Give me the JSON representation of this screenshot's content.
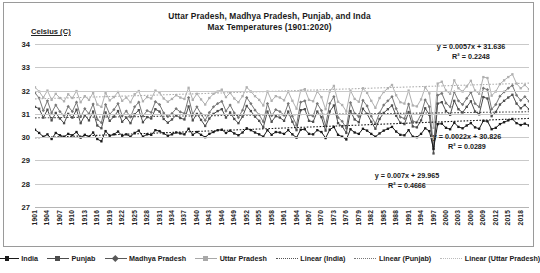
{
  "chart_data": {
    "type": "line",
    "title": "Uttar Pradesh, Madhya Pradesh, Punjab, and Inda\nMax Temperatures (1901:2020)",
    "title_line1": "Uttar Pradesh, Madhya Pradesh, Punjab, and Inda",
    "title_line2": "Max Temperatures (1901:2020)",
    "ylabel": "Celsius (C)",
    "xlabel": "",
    "ylim": [
      27,
      34
    ],
    "yticks": [
      34,
      33,
      32,
      31,
      30,
      29,
      28,
      27
    ],
    "xlim": [
      1901,
      2020
    ],
    "xticks": [
      1901,
      1904,
      1907,
      1910,
      1913,
      1916,
      1919,
      1922,
      1925,
      1928,
      1931,
      1934,
      1937,
      1940,
      1943,
      1946,
      1949,
      1952,
      1955,
      1958,
      1961,
      1964,
      1967,
      1970,
      1973,
      1976,
      1979,
      1982,
      1985,
      1988,
      1991,
      1994,
      1997,
      2000,
      2003,
      2006,
      2009,
      2012,
      2015,
      2018
    ],
    "grid": true,
    "legend_position": "bottom",
    "x": [
      1901,
      1902,
      1903,
      1904,
      1905,
      1906,
      1907,
      1908,
      1909,
      1910,
      1911,
      1912,
      1913,
      1914,
      1915,
      1916,
      1917,
      1918,
      1919,
      1920,
      1921,
      1922,
      1923,
      1924,
      1925,
      1926,
      1927,
      1928,
      1929,
      1930,
      1931,
      1932,
      1933,
      1934,
      1935,
      1936,
      1937,
      1938,
      1939,
      1940,
      1941,
      1942,
      1943,
      1944,
      1945,
      1946,
      1947,
      1948,
      1949,
      1950,
      1951,
      1952,
      1953,
      1954,
      1955,
      1956,
      1957,
      1958,
      1959,
      1960,
      1961,
      1962,
      1963,
      1964,
      1965,
      1966,
      1967,
      1968,
      1969,
      1970,
      1971,
      1972,
      1973,
      1974,
      1975,
      1976,
      1977,
      1978,
      1979,
      1980,
      1981,
      1982,
      1983,
      1984,
      1985,
      1986,
      1987,
      1988,
      1989,
      1990,
      1991,
      1992,
      1993,
      1994,
      1995,
      1996,
      1997,
      1998,
      1999,
      2000,
      2001,
      2002,
      2003,
      2004,
      2005,
      2006,
      2007,
      2008,
      2009,
      2010,
      2011,
      2012,
      2013,
      2014,
      2015,
      2016,
      2017,
      2018,
      2019,
      2020
    ],
    "series": [
      {
        "name": "India",
        "color": "#1a1a1a",
        "marker": "square",
        "values": [
          30.32,
          30.18,
          30.02,
          30.12,
          29.92,
          30.18,
          30.08,
          30.02,
          30.14,
          30.08,
          30.22,
          29.98,
          30.1,
          30.02,
          30.2,
          29.92,
          29.82,
          30.26,
          30.06,
          30.12,
          30.24,
          30.06,
          30.12,
          30.02,
          30.18,
          30.28,
          30.02,
          30.12,
          30.1,
          30.3,
          30.26,
          30.16,
          30.06,
          30.12,
          30.2,
          30.16,
          30.12,
          30.36,
          30.1,
          30.22,
          30.1,
          30.0,
          30.14,
          30.22,
          30.3,
          30.32,
          30.18,
          30.28,
          30.16,
          30.08,
          30.2,
          30.38,
          30.3,
          30.2,
          30.12,
          30.02,
          30.3,
          30.1,
          30.22,
          30.2,
          30.14,
          30.3,
          30.12,
          29.98,
          30.32,
          30.34,
          30.14,
          30.12,
          30.3,
          30.22,
          29.96,
          30.32,
          30.44,
          30.1,
          30.02,
          29.9,
          30.34,
          30.2,
          30.14,
          30.36,
          30.28,
          30.14,
          30.02,
          30.16,
          30.28,
          30.36,
          30.44,
          30.24,
          30.1,
          30.08,
          30.3,
          30.02,
          30.0,
          30.14,
          30.38,
          30.26,
          29.5,
          30.56,
          30.58,
          30.4,
          30.34,
          30.62,
          30.44,
          30.38,
          30.5,
          30.6,
          30.42,
          30.36,
          30.7,
          30.68,
          30.34,
          30.4,
          30.56,
          30.64,
          30.72,
          30.78,
          30.6,
          30.52,
          30.58,
          30.5
        ]
      },
      {
        "name": "Punjab",
        "color": "#4d4d4d",
        "marker": "square",
        "values": [
          31.3,
          31.22,
          30.84,
          31.18,
          30.72,
          31.04,
          30.8,
          30.6,
          31.0,
          30.84,
          31.18,
          30.6,
          30.94,
          30.72,
          31.1,
          30.5,
          30.38,
          31.06,
          30.7,
          30.88,
          31.12,
          30.66,
          30.84,
          30.6,
          30.98,
          31.16,
          30.64,
          30.86,
          30.8,
          31.2,
          31.1,
          30.78,
          30.62,
          30.76,
          30.94,
          30.82,
          30.76,
          31.32,
          30.72,
          31.0,
          30.74,
          30.48,
          30.8,
          31.0,
          31.12,
          31.2,
          30.84,
          31.06,
          30.78,
          30.6,
          30.88,
          31.34,
          31.12,
          30.88,
          30.7,
          30.42,
          31.1,
          30.66,
          30.9,
          30.84,
          30.7,
          31.1,
          30.66,
          30.3,
          31.16,
          31.2,
          30.7,
          30.66,
          31.1,
          30.86,
          30.28,
          31.1,
          31.36,
          30.6,
          30.46,
          30.18,
          31.12,
          30.76,
          30.64,
          31.22,
          31.0,
          30.66,
          30.36,
          30.78,
          31.04,
          31.2,
          31.36,
          30.92,
          30.62,
          30.56,
          31.08,
          30.46,
          30.42,
          30.72,
          31.24,
          30.96,
          29.3,
          31.44,
          31.5,
          31.12,
          30.96,
          31.56,
          31.2,
          31.06,
          31.3,
          31.54,
          31.1,
          30.98,
          31.72,
          31.66,
          30.9,
          31.08,
          31.4,
          31.56,
          31.7,
          31.82,
          31.44,
          31.24,
          31.38,
          31.2
        ]
      },
      {
        "name": "Madhya Pradesh",
        "color": "#777777",
        "marker": "diamond",
        "values": [
          31.9,
          31.68,
          31.14,
          31.56,
          31.04,
          31.38,
          31.1,
          30.92,
          31.32,
          31.1,
          31.5,
          30.88,
          31.22,
          31.0,
          31.42,
          30.76,
          30.62,
          31.4,
          30.98,
          31.18,
          31.44,
          30.92,
          31.12,
          30.86,
          31.3,
          31.5,
          30.9,
          31.14,
          31.06,
          31.52,
          31.4,
          31.04,
          30.88,
          31.02,
          31.22,
          31.08,
          31.02,
          31.7,
          30.98,
          31.3,
          31.0,
          30.72,
          31.06,
          31.3,
          31.44,
          31.54,
          31.12,
          31.38,
          31.04,
          30.84,
          31.16,
          31.7,
          31.44,
          31.16,
          30.96,
          30.66,
          31.44,
          30.92,
          31.18,
          31.1,
          30.94,
          31.44,
          30.9,
          30.52,
          31.5,
          31.56,
          30.96,
          30.9,
          31.44,
          31.14,
          30.5,
          31.44,
          31.74,
          30.84,
          30.68,
          30.38,
          31.48,
          31.02,
          30.88,
          31.58,
          31.34,
          30.9,
          30.58,
          31.04,
          31.38,
          31.56,
          31.74,
          31.22,
          30.86,
          30.8,
          31.42,
          30.68,
          30.64,
          30.98,
          31.6,
          31.3,
          29.6,
          31.8,
          31.88,
          31.46,
          31.3,
          31.94,
          31.56,
          31.4,
          31.66,
          31.92,
          31.44,
          31.3,
          32.1,
          32.04,
          31.2,
          31.4,
          31.76,
          31.94,
          32.1,
          32.22,
          31.8,
          31.58,
          31.74,
          31.54
        ]
      },
      {
        "name": "Uttar Pradesh",
        "color": "#b0b0b0",
        "marker": "square",
        "values": [
          32.14,
          31.96,
          31.7,
          32.0,
          31.6,
          31.86,
          31.68,
          31.54,
          31.84,
          31.68,
          31.98,
          31.5,
          31.76,
          31.6,
          31.9,
          31.4,
          31.3,
          31.9,
          31.58,
          31.72,
          31.94,
          31.56,
          31.7,
          31.5,
          31.84,
          31.98,
          31.54,
          31.72,
          31.66,
          32.0,
          31.92,
          31.66,
          31.52,
          31.64,
          31.8,
          31.7,
          31.64,
          32.12,
          31.6,
          31.86,
          31.62,
          31.4,
          31.68,
          31.86,
          31.96,
          32.04,
          31.72,
          31.9,
          31.66,
          31.5,
          31.76,
          32.14,
          31.96,
          31.76,
          31.6,
          31.36,
          31.96,
          31.56,
          31.76,
          31.7,
          31.58,
          31.96,
          31.56,
          31.22,
          32.0,
          32.06,
          31.6,
          31.54,
          31.96,
          31.72,
          31.2,
          31.96,
          32.2,
          31.52,
          31.38,
          31.1,
          32.0,
          31.64,
          31.52,
          32.1,
          31.9,
          31.56,
          31.26,
          31.68,
          31.94,
          32.1,
          32.24,
          31.8,
          31.5,
          31.44,
          32.0,
          31.36,
          31.32,
          31.62,
          32.14,
          31.88,
          30.4,
          32.3,
          32.38,
          32.0,
          31.86,
          32.44,
          32.1,
          31.96,
          32.18,
          32.42,
          32.0,
          31.86,
          32.58,
          32.54,
          31.78,
          31.96,
          32.28,
          32.44,
          32.58,
          32.7,
          32.3,
          32.1,
          32.24,
          32.06
        ]
      }
    ],
    "trendlines": [
      {
        "name": "Linear (Uttar Pradesh)",
        "color": "#b0b0b0",
        "equation": "y = 0.0057x + 31.636",
        "r2": "R² = 0.2248",
        "slope": 0.0057,
        "intercept": 31.636,
        "r2_value": 0.2248
      },
      {
        "name": "Linear (Punjab)",
        "color": "#4d4d4d",
        "equation": "y = 0.0022x + 30.826",
        "r2": "R² = 0.0289",
        "slope": 0.0022,
        "intercept": 30.826,
        "r2_value": 0.0289
      },
      {
        "name": "Linear (India)",
        "color": "#1a1a1a",
        "equation": "y = 0.007x + 29.965",
        "r2": "R² = 0.4666",
        "slope": 0.007,
        "intercept": 29.965,
        "r2_value": 0.4666
      }
    ],
    "legend": [
      {
        "label": "India",
        "color": "#1a1a1a",
        "style": "solid",
        "marker": "square"
      },
      {
        "label": "Punjab",
        "color": "#4d4d4d",
        "style": "solid",
        "marker": "square"
      },
      {
        "label": "Madhya Pradesh",
        "color": "#595959",
        "style": "solid",
        "marker": "diamond"
      },
      {
        "label": "Uttar Pradesh",
        "color": "#a8a8a8",
        "style": "solid",
        "marker": "square"
      },
      {
        "label": "Linear (India)",
        "color": "#555555",
        "style": "dotted",
        "marker": "none"
      },
      {
        "label": "Linear (Punjab)",
        "color": "#777777",
        "style": "dotted",
        "marker": "none"
      },
      {
        "label": "Linear (Uttar Pradesh)",
        "color": "#bbbbbb",
        "style": "dotted",
        "marker": "none"
      }
    ]
  }
}
